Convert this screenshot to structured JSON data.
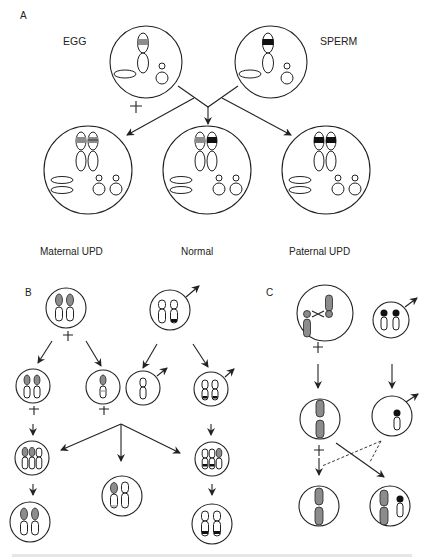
{
  "figure": {
    "panels": {
      "A": {
        "label": "A",
        "parents": {
          "egg": "EGG",
          "sperm": "SPERM"
        },
        "outcomes": [
          "Maternal UPD",
          "Normal",
          "Paternal UPD"
        ]
      },
      "B": {
        "label": "B"
      },
      "C": {
        "label": "C"
      }
    },
    "symbols": {
      "female": "♀",
      "male": "♂"
    },
    "colors": {
      "maternal_band": "#8c8c8c",
      "paternal_band": "#111111",
      "stroke": "#222222",
      "background": "#ffffff"
    }
  }
}
